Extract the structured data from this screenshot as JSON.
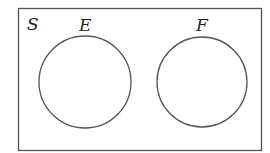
{
  "diagram": {
    "type": "venn",
    "universe": {
      "label": "S"
    },
    "sets": [
      {
        "label": "E"
      },
      {
        "label": "F"
      }
    ],
    "overlap": false,
    "colors": {
      "stroke": "#555555",
      "background": "#ffffff",
      "text": "#222222"
    }
  }
}
